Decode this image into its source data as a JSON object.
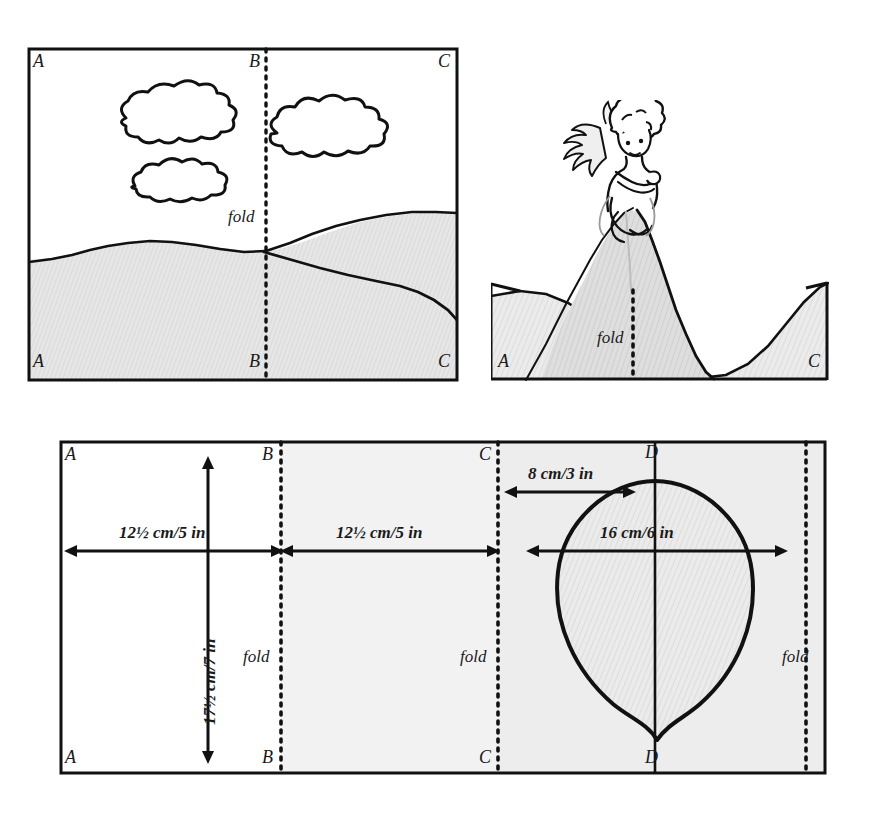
{
  "figure": {
    "title_text": "",
    "type": "craft-pattern-diagram",
    "panels": [
      {
        "id": "top-left",
        "name": "landscape-scene-panel",
        "description": "Rectangular scene with clouds, hills and a vertical dotted fold line",
        "corner_labels": [
          "A",
          "B",
          "C",
          "A",
          "B",
          "C"
        ],
        "fold_label": "fold",
        "fold_count": 1
      },
      {
        "id": "top-right",
        "name": "folded-mountain-scene-panel",
        "description": "Folded pop-up view showing a fairy seated on a mountain peak",
        "corner_labels": [
          "A",
          "C"
        ],
        "fold_label": "fold",
        "fold_count": 1
      },
      {
        "id": "bottom",
        "name": "pattern-measurement-panel",
        "description": "Flat pattern sheet with fold lines, dimension arrows and a balloon shape",
        "corner_labels": [
          "A",
          "B",
          "C",
          "D",
          "A",
          "B",
          "C",
          "D"
        ],
        "fold_label": "fold",
        "fold_count": 3
      }
    ]
  },
  "labels": {
    "A": "A",
    "B": "B",
    "C": "C",
    "D": "D",
    "fold": "fold"
  },
  "dimensions": {
    "panel_width_1": "12½ cm/5 in",
    "panel_width_2": "12½ cm/5 in",
    "panel_height": "17½ cm/7 in",
    "balloon_offset": "8 cm/3 in",
    "balloon_width": "16 cm/6 in"
  },
  "colors": {
    "ink": "#111111",
    "paper": "#ffffff",
    "shade_light": "#e2e2e2",
    "shade_mid": "#d6d6d6",
    "shade_dark": "#cccccc",
    "fold_dot": "#111111"
  }
}
